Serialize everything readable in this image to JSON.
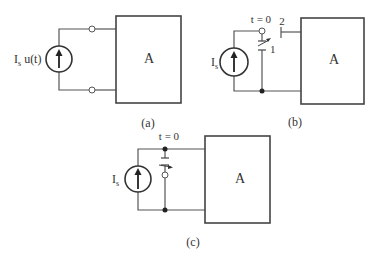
{
  "diagram": {
    "type": "circuit-schematic",
    "panels": [
      {
        "id": "a",
        "caption": "(a)",
        "source_label": "I",
        "source_subscript": "s",
        "source_suffix": " u(t)",
        "block_label": "A",
        "elements": [
          "current-source",
          "two-terminals",
          "block-A"
        ]
      },
      {
        "id": "b",
        "caption": "(b)",
        "source_label": "I",
        "source_subscript": "s",
        "block_label": "A",
        "switch_time": "t = 0",
        "switch_pos_1": "1",
        "switch_pos_2": "2",
        "elements": [
          "current-source",
          "spdt-switch",
          "block-A"
        ]
      },
      {
        "id": "c",
        "caption": "(c)",
        "source_label": "I",
        "source_subscript": "s",
        "block_label": "A",
        "switch_time": "t = 0",
        "elements": [
          "current-source",
          "shunt-switch",
          "block-A"
        ]
      }
    ]
  }
}
